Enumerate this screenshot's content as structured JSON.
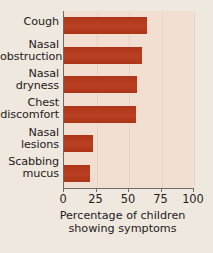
{
  "chart_data": {
    "type": "bar",
    "orientation": "horizontal",
    "title": "",
    "xlabel": "Percentage of children showing symptoms",
    "xlabel_line1": "Percentage of children",
    "xlabel_line2": "showing symptoms",
    "ylabel": "",
    "categories": [
      "Cough",
      "Nasal obstruction",
      "Nasal dryness",
      "Chest discomfort",
      "Nasal lesions",
      "Scabbing mucus"
    ],
    "category_lines": [
      [
        "Cough"
      ],
      [
        "Nasal",
        "obstruction"
      ],
      [
        "Nasal",
        "dryness"
      ],
      [
        "Chest",
        "discomfort"
      ],
      [
        "Nasal",
        "lesions"
      ],
      [
        "Scabbing",
        "mucus"
      ]
    ],
    "values": [
      64,
      60,
      56,
      55,
      22,
      20
    ],
    "xlim": [
      0,
      100
    ],
    "xticks": [
      0,
      25,
      50,
      75,
      100
    ],
    "xticklabels": [
      "0",
      "25",
      "50",
      "75",
      "100"
    ],
    "grid": "vertical-faint",
    "legend": "none",
    "bar_color": "#b33a1d",
    "plot_background": "#f3dfd2",
    "figure_background": "#efe8de",
    "axis_color": "#6f6a63"
  },
  "caption_bleed": "Figure: Children and symptoms"
}
